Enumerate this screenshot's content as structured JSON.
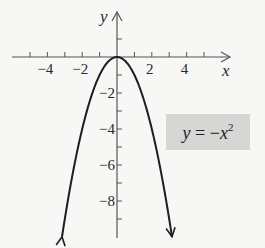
{
  "chart_data": {
    "type": "line",
    "title": "",
    "xlabel": "x",
    "ylabel": "y",
    "equation": {
      "lhs": "y",
      "eq": " = ",
      "neg": "−",
      "var": "x",
      "exp": "2"
    },
    "equation_text": "y = −x²",
    "xlim": [
      -5,
      5
    ],
    "ylim": [
      -10,
      1
    ],
    "x_ticks": [
      -5,
      -4,
      -3,
      -2,
      -1,
      1,
      2,
      3,
      4,
      5
    ],
    "x_tick_labels": [
      "−4",
      "−2",
      "2",
      "4"
    ],
    "x_tick_label_values": [
      -4,
      -2,
      2,
      4
    ],
    "y_ticks": [
      1,
      -1,
      -2,
      -3,
      -4,
      -5,
      -6,
      -7,
      -8,
      -9
    ],
    "y_tick_labels": [
      "−2",
      "−4",
      "−6",
      "−8"
    ],
    "y_tick_label_values": [
      -2,
      -4,
      -6,
      -8
    ],
    "grid": false,
    "series": [
      {
        "name": "y = -x^2",
        "x": [
          -3.16,
          -3,
          -2.5,
          -2,
          -1.5,
          -1,
          -0.5,
          0,
          0.5,
          1,
          1.5,
          2,
          2.5,
          3,
          3.16
        ],
        "y": [
          -10,
          -9,
          -6.25,
          -4,
          -2.25,
          -1,
          -0.25,
          0,
          -0.25,
          -1,
          -2.25,
          -4,
          -6.25,
          -9,
          -10
        ],
        "arrows_at_ends": true
      }
    ]
  },
  "colors": {
    "background": "#f7f7f5",
    "curve": "#1e1e1e",
    "axis": "#555555",
    "label_box": "#d6d6d4"
  }
}
